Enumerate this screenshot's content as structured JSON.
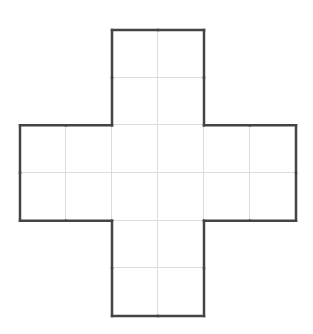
{
  "figure": {
    "type": "cross-net-grid",
    "grid_columns": 6,
    "grid_rows": 6,
    "origin_x": 20,
    "origin_y": 30,
    "cell_width": 46,
    "cell_height": 47.67,
    "filled_cells": [
      [
        0,
        2
      ],
      [
        0,
        3
      ],
      [
        1,
        2
      ],
      [
        1,
        3
      ],
      [
        2,
        0
      ],
      [
        2,
        1
      ],
      [
        2,
        2
      ],
      [
        2,
        3
      ],
      [
        2,
        4
      ],
      [
        2,
        5
      ],
      [
        3,
        0
      ],
      [
        3,
        1
      ],
      [
        3,
        2
      ],
      [
        3,
        3
      ],
      [
        3,
        4
      ],
      [
        3,
        5
      ],
      [
        4,
        2
      ],
      [
        4,
        3
      ],
      [
        5,
        2
      ],
      [
        5,
        3
      ]
    ],
    "outline_color": "#444444",
    "outline_width": 2.5,
    "gridline_color": "#dcdcdc",
    "background": "#ffffff"
  }
}
